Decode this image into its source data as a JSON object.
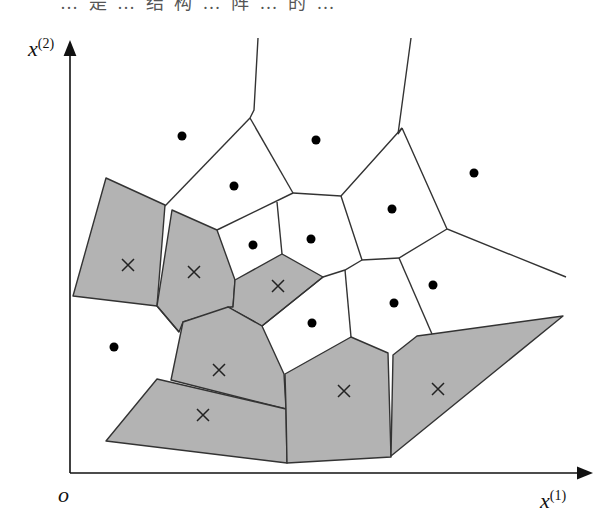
{
  "header": {
    "cut_text": "… 是 … 结 构 … 阵 … 的 … "
  },
  "axes": {
    "y_label": "x",
    "y_label_sup": "(2)",
    "x_label": "x",
    "x_label_sup": "(1)",
    "origin_label": "o"
  },
  "colors": {
    "gray_fill": "#b3b3b3",
    "edge": "#333333",
    "axis": "#111111",
    "dot": "#000000"
  },
  "gray_cells": [
    [
      [
        106,
        178
      ],
      [
        165,
        205
      ],
      [
        157,
        306
      ],
      [
        73,
        296
      ]
    ],
    [
      [
        172,
        210
      ],
      [
        217,
        230
      ],
      [
        235,
        280
      ],
      [
        233,
        307
      ],
      [
        183,
        322
      ],
      [
        179,
        332
      ],
      [
        157,
        306
      ]
    ],
    [
      [
        235,
        280
      ],
      [
        282,
        254
      ],
      [
        323,
        277
      ],
      [
        262,
        326
      ],
      [
        228,
        307
      ],
      [
        233,
        307
      ]
    ],
    [
      [
        183,
        322
      ],
      [
        228,
        307
      ],
      [
        262,
        326
      ],
      [
        284,
        374
      ],
      [
        286,
        409
      ],
      [
        171,
        380
      ]
    ],
    [
      [
        157,
        379
      ],
      [
        286,
        409
      ],
      [
        287,
        463
      ],
      [
        106,
        441
      ]
    ],
    [
      [
        285,
        374
      ],
      [
        351,
        337
      ],
      [
        388,
        353
      ],
      [
        391,
        457
      ],
      [
        287,
        463
      ],
      [
        286,
        409
      ]
    ],
    [
      [
        393,
        355
      ],
      [
        417,
        336
      ],
      [
        432,
        334
      ],
      [
        563,
        316
      ],
      [
        391,
        456
      ]
    ]
  ],
  "edges": [
    [
      [
        258,
        38
      ],
      [
        254,
        110
      ],
      [
        250,
        118
      ]
    ],
    [
      [
        411,
        38
      ],
      [
        398,
        134
      ],
      [
        402,
        128
      ]
    ],
    [
      [
        250,
        118
      ],
      [
        165,
        206
      ]
    ],
    [
      [
        250,
        118
      ],
      [
        293,
        193
      ]
    ],
    [
      [
        293,
        193
      ],
      [
        341,
        196
      ],
      [
        402,
        128
      ]
    ],
    [
      [
        402,
        128
      ],
      [
        447,
        229
      ],
      [
        566,
        277
      ]
    ],
    [
      [
        293,
        193
      ],
      [
        217,
        230
      ]
    ],
    [
      [
        277,
        202
      ],
      [
        282,
        254
      ]
    ],
    [
      [
        341,
        196
      ],
      [
        362,
        260
      ],
      [
        399,
        258
      ],
      [
        447,
        229
      ]
    ],
    [
      [
        323,
        277
      ],
      [
        345,
        270
      ],
      [
        362,
        260
      ]
    ],
    [
      [
        345,
        270
      ],
      [
        351,
        337
      ]
    ],
    [
      [
        399,
        258
      ],
      [
        432,
        334
      ]
    ],
    [
      [
        262,
        326
      ],
      [
        323,
        277
      ]
    ],
    [
      [
        157,
        306
      ],
      [
        179,
        332
      ]
    ]
  ],
  "dots": [
    [
      182,
      136
    ],
    [
      316,
      140
    ],
    [
      474,
      173
    ],
    [
      234,
      186
    ],
    [
      392,
      209
    ],
    [
      253,
      245
    ],
    [
      311,
      239
    ],
    [
      433,
      285
    ],
    [
      394,
      303
    ],
    [
      312,
      323
    ],
    [
      114,
      347
    ]
  ],
  "crosses": [
    [
      128,
      265
    ],
    [
      194,
      272
    ],
    [
      278,
      286
    ],
    [
      219,
      370
    ],
    [
      203,
      415
    ],
    [
      344,
      391
    ],
    [
      438,
      389
    ]
  ]
}
